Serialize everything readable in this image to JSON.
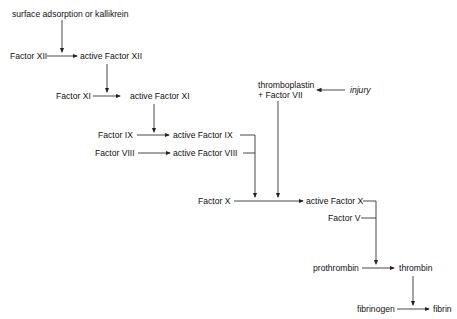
{
  "nodes": {
    "surface": "surface adsorption or kallikrein",
    "f12": "Factor XII",
    "af12": "active Factor XII",
    "f11": "Factor XI",
    "af11": "active Factor XI",
    "f9": "Factor IX",
    "af9": "active Factor IX",
    "f8": "Factor VIII",
    "af8": "active Factor VIII",
    "tp1": "thromboplastin",
    "tp2": "+ Factor VII",
    "injury": "injury",
    "f10": "Factor X",
    "af10": "active Factor X",
    "f5": "Factor V",
    "prothrombin": "prothrombin",
    "thrombin": "thrombin",
    "fibrinogen": "fibrinogen",
    "fibrin": "fibrin"
  },
  "colors": {
    "line": "#333333",
    "text": "#111111"
  }
}
